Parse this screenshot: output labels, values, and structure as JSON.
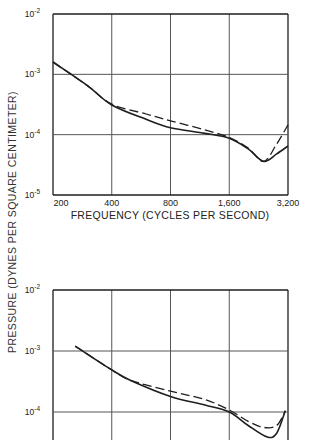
{
  "y_axis_label": "PRESSURE (DYNES PER SQUARE CENTIMETER)",
  "x_axis_label": "FREQUENCY (CYCLES PER SECOND)",
  "chart_data": [
    {
      "type": "line",
      "title": "",
      "xlabel": "FREQUENCY (CYCLES PER SECOND)",
      "ylabel": "PRESSURE (DYNES PER SQUARE CENTIMETER)",
      "x_scale": "log",
      "y_scale": "log",
      "x_ticks": [
        "200",
        "400",
        "800",
        "1,600",
        "3,200"
      ],
      "y_ticks": [
        "10^-2",
        "10^-3",
        "10^-4",
        "10^-5"
      ],
      "xlim": [
        200,
        3200
      ],
      "ylim": [
        1e-05,
        0.01
      ],
      "grid": true,
      "series": [
        {
          "name": "solid",
          "style": "solid",
          "x": [
            200,
            300,
            400,
            600,
            800,
            1200,
            1600,
            2000,
            2400,
            2800,
            3200
          ],
          "y": [
            0.0016,
            0.00065,
            0.00031,
            0.00018,
            0.00013,
            0.000105,
            8.7e-05,
            5.8e-05,
            3.6e-05,
            4.8e-05,
            6.5e-05
          ]
        },
        {
          "name": "dashed",
          "style": "dashed",
          "x": [
            200,
            300,
            400,
            600,
            800,
            1200,
            1600,
            2000,
            2400,
            2800,
            3200
          ],
          "y": [
            0.0016,
            0.00065,
            0.00032,
            0.00022,
            0.00017,
            0.00012,
            9e-05,
            6e-05,
            3.6e-05,
            7e-05,
            0.000145
          ]
        }
      ]
    },
    {
      "type": "line",
      "title": "",
      "xlabel": "",
      "ylabel": "PRESSURE (DYNES PER SQUARE CENTIMETER)",
      "x_scale": "log",
      "y_scale": "log",
      "x_ticks": [],
      "y_ticks": [
        "10^-2",
        "10^-3",
        "10^-4"
      ],
      "xlim": [
        200,
        3200
      ],
      "ylim": [
        1e-05,
        0.01
      ],
      "grid": true,
      "series": [
        {
          "name": "solid",
          "style": "solid",
          "x": [
            260,
            400,
            500,
            800,
            1200,
            1600,
            2000,
            2500,
            2800,
            3100
          ],
          "y": [
            0.0012,
            0.00049,
            0.00033,
            0.00018,
            0.00013,
            0.0001,
            6e-05,
            3.9e-05,
            4.5e-05,
            0.000105
          ]
        },
        {
          "name": "dashed",
          "style": "dashed",
          "x": [
            260,
            400,
            500,
            800,
            1200,
            1600,
            2000,
            2400,
            2800,
            3100
          ],
          "y": [
            0.0012,
            0.00049,
            0.00033,
            0.00022,
            0.00016,
            0.000108,
            7e-05,
            5.6e-05,
            6e-05,
            0.000105
          ]
        }
      ]
    }
  ],
  "top": {
    "y_tick_labels": [
      {
        "base": "10",
        "exp": "-2"
      },
      {
        "base": "10",
        "exp": "-3"
      },
      {
        "base": "10",
        "exp": "-4"
      },
      {
        "base": "10",
        "exp": "-5"
      }
    ],
    "x_tick_labels": [
      "200",
      "400",
      "800",
      "1,600",
      "3,200"
    ]
  },
  "bottom": {
    "y_tick_labels": [
      {
        "base": "10",
        "exp": "-2"
      },
      {
        "base": "10",
        "exp": "-3"
      },
      {
        "base": "10",
        "exp": "-4"
      }
    ]
  },
  "colors": {
    "ink": "#1e1e1e",
    "grid": "#555555",
    "background": "#ffffff"
  }
}
